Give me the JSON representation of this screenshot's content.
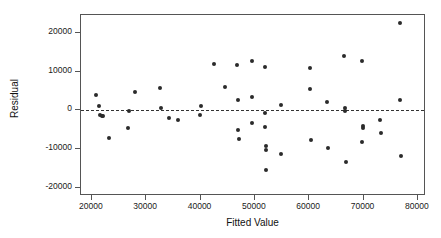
{
  "chart_data": {
    "type": "scatter",
    "title": "",
    "xlabel": "Fitted Value",
    "ylabel": "Residual",
    "xlim": [
      18000,
      81500
    ],
    "ylim": [
      -22200,
      24700
    ],
    "xticks": [
      20000,
      30000,
      40000,
      50000,
      60000,
      70000,
      80000
    ],
    "xtick_labels": [
      "20000",
      "30000",
      "40000",
      "50000",
      "60000",
      "70000",
      "80000"
    ],
    "yticks": [
      20000,
      10000,
      0,
      -10000,
      -20000
    ],
    "ytick_labels": [
      "20000",
      "10000",
      "0",
      "-10000",
      "-20000"
    ],
    "grid": false,
    "legend": null,
    "reference_line": {
      "type": "horizontal-dashed",
      "y": 0
    },
    "points": [
      {
        "x": 20700,
        "y": 3900
      },
      {
        "x": 21300,
        "y": 1000
      },
      {
        "x": 21500,
        "y": -1100
      },
      {
        "x": 21900,
        "y": -1600
      },
      {
        "x": 22000,
        "y": -1500
      },
      {
        "x": 23100,
        "y": -7200
      },
      {
        "x": 26600,
        "y": -4600
      },
      {
        "x": 26900,
        "y": -300
      },
      {
        "x": 28000,
        "y": 4800
      },
      {
        "x": 32500,
        "y": 5900
      },
      {
        "x": 32700,
        "y": 700
      },
      {
        "x": 34200,
        "y": -2000
      },
      {
        "x": 35900,
        "y": -2400
      },
      {
        "x": 39900,
        "y": -1300
      },
      {
        "x": 40100,
        "y": 1100
      },
      {
        "x": 42400,
        "y": 11900
      },
      {
        "x": 44500,
        "y": 6100
      },
      {
        "x": 46700,
        "y": 11800
      },
      {
        "x": 46900,
        "y": 2800
      },
      {
        "x": 46900,
        "y": -5000
      },
      {
        "x": 47000,
        "y": -7400
      },
      {
        "x": 49400,
        "y": 12800
      },
      {
        "x": 49400,
        "y": 3400
      },
      {
        "x": 49500,
        "y": -3200
      },
      {
        "x": 51800,
        "y": 11100
      },
      {
        "x": 51900,
        "y": -600
      },
      {
        "x": 51900,
        "y": -4400
      },
      {
        "x": 52000,
        "y": -9200
      },
      {
        "x": 52000,
        "y": -10400
      },
      {
        "x": 52100,
        "y": -15400
      },
      {
        "x": 54800,
        "y": 1300
      },
      {
        "x": 54900,
        "y": -11200
      },
      {
        "x": 60200,
        "y": 10900
      },
      {
        "x": 60200,
        "y": 5400
      },
      {
        "x": 60300,
        "y": -7700
      },
      {
        "x": 63200,
        "y": 2100
      },
      {
        "x": 63500,
        "y": -9800
      },
      {
        "x": 66400,
        "y": 14200
      },
      {
        "x": 66600,
        "y": 600
      },
      {
        "x": 66600,
        "y": -200
      },
      {
        "x": 66700,
        "y": -13300
      },
      {
        "x": 69700,
        "y": 12800
      },
      {
        "x": 69700,
        "y": -8200
      },
      {
        "x": 69900,
        "y": -4000
      },
      {
        "x": 69900,
        "y": -4700
      },
      {
        "x": 73100,
        "y": -2400
      },
      {
        "x": 73200,
        "y": -5800
      },
      {
        "x": 76700,
        "y": 2800
      },
      {
        "x": 76800,
        "y": 22500
      },
      {
        "x": 76900,
        "y": -11800
      }
    ]
  }
}
